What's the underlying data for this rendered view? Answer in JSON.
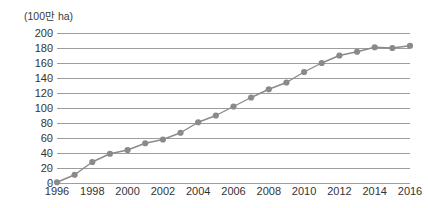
{
  "chart_data": {
    "type": "line",
    "title": "",
    "subtitle": "",
    "unit_label": "(100만 ha)",
    "xlabel": "",
    "ylabel": "",
    "ylim": [
      0,
      200
    ],
    "xlim": [
      1996,
      2016
    ],
    "grid": true,
    "legend": false,
    "legend_position": "none",
    "marker": "circle",
    "series_color": "#8a8a8a",
    "grid_color": "#9d9d9d",
    "ytick_values": [
      0,
      20,
      40,
      60,
      80,
      100,
      120,
      140,
      160,
      180,
      200
    ],
    "ytick_labels": [
      "0",
      "20",
      "40",
      "60",
      "80",
      "100",
      "120",
      "140",
      "160",
      "180",
      "200"
    ],
    "xtick_values": [
      1996,
      1998,
      2000,
      2002,
      2004,
      2006,
      2008,
      2010,
      2012,
      2014,
      2016
    ],
    "xtick_labels": [
      "1996",
      "1998",
      "2000",
      "2002",
      "2004",
      "2006",
      "2008",
      "2010",
      "2012",
      "2014",
      "2016"
    ],
    "x": [
      1996,
      1997,
      1998,
      1999,
      2000,
      2001,
      2002,
      2003,
      2004,
      2005,
      2006,
      2007,
      2008,
      2009,
      2010,
      2011,
      2012,
      2013,
      2014,
      2015,
      2016
    ],
    "values": [
      1,
      11,
      28,
      39,
      44,
      53,
      58,
      67,
      81,
      90,
      102,
      114,
      125,
      134,
      148,
      160,
      170,
      175,
      181,
      180,
      183
    ],
    "series": [
      {
        "name": "",
        "values": [
          1,
          11,
          28,
          39,
          44,
          53,
          58,
          67,
          81,
          90,
          102,
          114,
          125,
          134,
          148,
          160,
          170,
          175,
          181,
          180,
          183
        ]
      }
    ]
  }
}
